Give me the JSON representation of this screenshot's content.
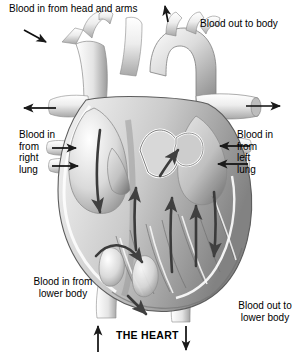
{
  "figure": {
    "title": "THE HEART",
    "type": "anatomical-diagram",
    "background_color": "#ffffff",
    "text_color": "#000000",
    "artwork_palette": {
      "outline": "#2b2b2b",
      "muscle_light": "#f2f2f2",
      "muscle_mid": "#cfcfcf",
      "muscle_dark": "#8e8e8e",
      "shadow": "#6a6a6a",
      "vessel_light": "#fbfbfb",
      "arrow": "#3a3a3a"
    }
  },
  "labels": {
    "head_and_arms": "Blood in from head and arms",
    "out_to_body": "Blood out to body",
    "right_lung": "Blood in\nfrom\nright\nlung",
    "left_lung": "Blood in\nfrom\nleft\nlung",
    "in_lower_body": "Blood in from\nlower body",
    "out_lower_body": "Blood out to\nlower body",
    "the_heart": "THE HEART"
  },
  "arrows": [
    {
      "name": "arrow-head-and-arms",
      "direction": "down-right",
      "note": "points into superior vena cava"
    },
    {
      "name": "arrow-out-to-body",
      "direction": "up",
      "note": "points out along aorta"
    },
    {
      "name": "arrow-superior-vena-cava-out-left",
      "direction": "left"
    },
    {
      "name": "arrow-right-lung-upper",
      "direction": "right"
    },
    {
      "name": "arrow-right-lung-lower",
      "direction": "right"
    },
    {
      "name": "arrow-aorta-out-right",
      "direction": "right"
    },
    {
      "name": "arrow-left-lung-upper",
      "direction": "left"
    },
    {
      "name": "arrow-left-lung-lower",
      "direction": "left"
    },
    {
      "name": "arrow-inferior-vena-cava-in",
      "direction": "up"
    },
    {
      "name": "arrow-descending-aorta-out",
      "direction": "down"
    },
    {
      "name": "arrow-flow-right-atrium-down",
      "direction": "down-curved",
      "location": "interior"
    },
    {
      "name": "arrow-flow-right-ventricle-up",
      "direction": "up",
      "location": "interior"
    },
    {
      "name": "arrow-flow-pulmonary-up",
      "direction": "up-right",
      "location": "interior"
    },
    {
      "name": "arrow-flow-left-ventricle-up",
      "direction": "up",
      "location": "interior"
    },
    {
      "name": "arrow-flow-left-atrium-down",
      "direction": "down",
      "location": "interior"
    },
    {
      "name": "arrow-flow-apex-curve",
      "direction": "curve-right",
      "location": "interior"
    }
  ]
}
